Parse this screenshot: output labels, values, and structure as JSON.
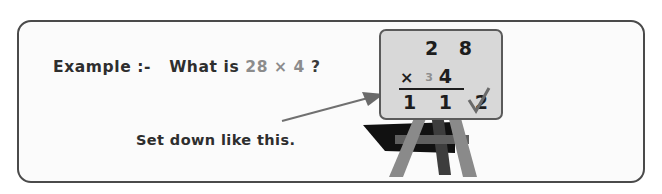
{
  "panel": {
    "question": {
      "lead": "Example :-   What is ",
      "expression": "28 × 4",
      "tail": " ?"
    },
    "caption": "Set down like this.",
    "arrow": {
      "icon": "arrow-right-icon",
      "direction": "up-right"
    }
  },
  "blackboard": {
    "multiplicand": "2 8",
    "multiplication_sign": "×",
    "carry": "3",
    "multiplier": "4",
    "product": "1 1 2",
    "check_mark": "✓",
    "board_color": "#d8d8d8",
    "frame_color": "#5a5a5a"
  },
  "easel": {
    "leg_color": "#8a8a8a",
    "leg_dark_color": "#6f6f6f",
    "shadow_color": "#111111",
    "parts": [
      "left-leg",
      "right-leg",
      "rear-leg",
      "crossbar",
      "shadow"
    ]
  },
  "colors": {
    "panel_border": "#4a4a4a",
    "panel_background": "#fbfbfb",
    "text_primary": "#2e2e2e",
    "text_muted": "#8c8c8c",
    "tick_color": "#6a6a6a"
  }
}
